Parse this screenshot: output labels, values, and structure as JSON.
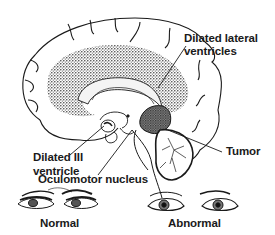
{
  "figure": {
    "labels": {
      "lateral_ventricles_line1": "Dilated lateral",
      "lateral_ventricles_line2": "ventricles",
      "third_ventricle_line1": "Dilated III",
      "third_ventricle_line2": "ventricle",
      "oculomotor": "Oculomotor nucleus",
      "tumor": "Tumor",
      "normal": "Normal",
      "abnormal": "Abnormal"
    },
    "colors": {
      "ink": "#1a1a1a",
      "stipple": "#555555",
      "background": "#ffffff"
    }
  }
}
